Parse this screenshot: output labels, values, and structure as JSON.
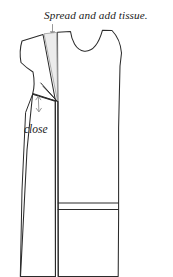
{
  "figure": {
    "background_color": "#ffffff",
    "line_color": "#2b2b2b",
    "annotation_color": "#8d8d8d",
    "tissue_wedge_fill": "#ececec",
    "tissue_wedge_stroke": "#9a9a9a",
    "annotations": {
      "top_caption": "Spread and add tissue.",
      "close_label": "close"
    },
    "markers": {
      "spread_arrow": "down-arrow-icon",
      "close_arrow": "double-headed-arrow-icon"
    },
    "elements": {
      "bodice": "dress-bodice-outline",
      "neckline": "neckline-curve",
      "left_shoulder_piece": "rotated-shoulder-segment",
      "tissue_wedge": "inserted-tissue-wedge",
      "dart": "closed-dart-wedge",
      "skirt_left": "left-skirt-panel",
      "skirt_right": "right-skirt-panel",
      "hem_seam": "horizontal-hem-seam"
    }
  }
}
